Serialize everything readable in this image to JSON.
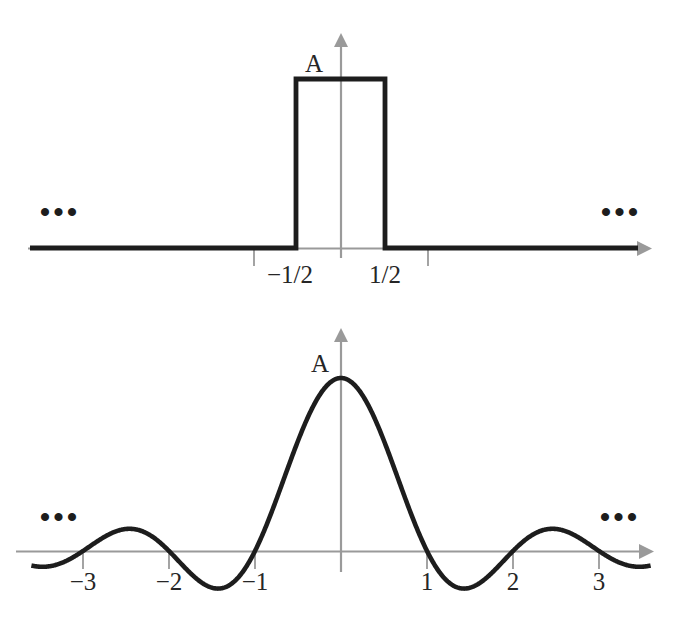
{
  "figure": {
    "amplitude_symbol": "A",
    "ellipsis": "•••"
  },
  "chart_data": [
    {
      "type": "line",
      "name": "rectangular-pulse",
      "title": "",
      "xlabel": "",
      "ylabel": "",
      "grid": false,
      "legend": null,
      "amplitude_label": "A",
      "xticks": [
        -1,
        -0.5,
        0.5,
        1
      ],
      "xtick_labels": [
        "",
        "−1/2",
        "1/2",
        ""
      ],
      "visible_tick_labels": [
        "−1/2",
        "1/2"
      ],
      "xlim": [
        -3.4,
        3.6
      ],
      "ylim": [
        -0.12,
        1.25
      ],
      "ellipsis_left": "•••",
      "ellipsis_right": "•••",
      "x": [
        -3.4,
        -0.5,
        -0.5,
        0.5,
        0.5,
        3.5
      ],
      "values": [
        0,
        0,
        1,
        1,
        0,
        0
      ],
      "annotation": "Value is A for |x| < 1/2 and 0 elsewhere"
    },
    {
      "type": "line",
      "name": "sinc-function",
      "title": "",
      "xlabel": "",
      "ylabel": "",
      "grid": false,
      "legend": null,
      "amplitude_label": "A",
      "xticks": [
        -3,
        -2,
        -1,
        1,
        2,
        3
      ],
      "xtick_labels": [
        "−3",
        "−2",
        "−1",
        "1",
        "2",
        "3"
      ],
      "xlim": [
        -3.6,
        3.6
      ],
      "ylim": [
        -0.3,
        1.2
      ],
      "ellipsis_left": "•••",
      "ellipsis_right": "•••",
      "zeros": [
        -3,
        -2,
        -1,
        1,
        2,
        3
      ],
      "peak": {
        "x": 0,
        "y": 1
      },
      "side_lobe_peaks": [
        {
          "x": -2.46,
          "y": 0.128
        },
        {
          "x": 2.46,
          "y": 0.128
        }
      ],
      "side_lobe_troughs": [
        {
          "x": -1.43,
          "y": -0.217
        },
        {
          "x": 1.43,
          "y": -0.217
        }
      ],
      "annotation": "A·sinc(x) = A·sin(πx)/(πx)"
    }
  ]
}
